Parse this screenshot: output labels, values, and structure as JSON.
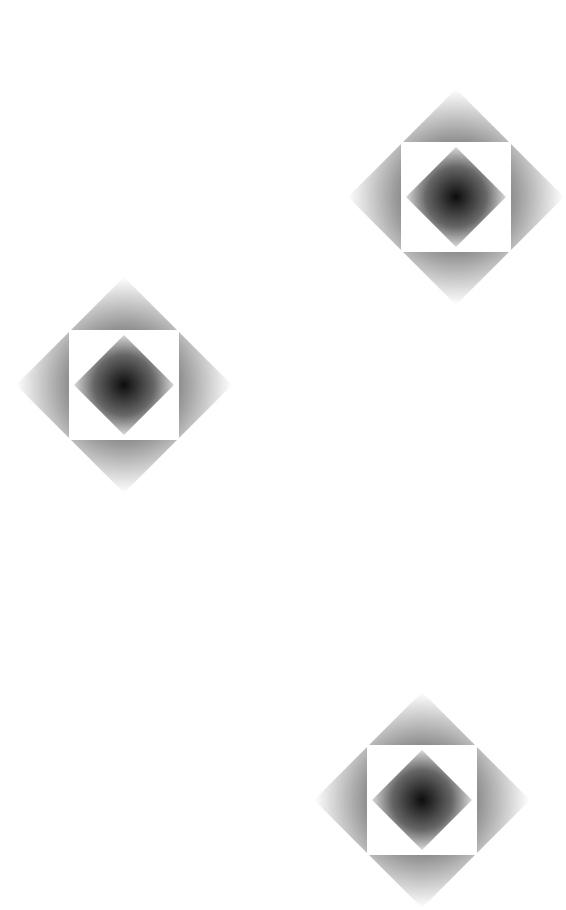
{
  "canvas": {
    "width": 520,
    "height": 729,
    "background": "#ffffff"
  },
  "pattern": {
    "description": "diamond gradient motif with white square cutout and inner dark diamond",
    "colors": {
      "dark": "#111111",
      "light": "#ffffff"
    },
    "motifs": [
      {
        "id": "motif-1",
        "cx": 456,
        "cy": 197
      },
      {
        "id": "motif-2",
        "cx": 124,
        "cy": 385
      },
      {
        "id": "motif-3",
        "cx": 422,
        "cy": 800
      }
    ]
  }
}
